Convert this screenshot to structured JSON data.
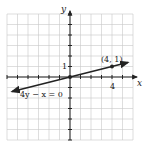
{
  "chart_data": {
    "type": "line",
    "title": "",
    "xlabel": "x",
    "ylabel": "y",
    "xlim": [
      -6,
      6
    ],
    "ylim": [
      -6,
      6
    ],
    "grid": true,
    "x_ticks_labeled": [
      4
    ],
    "y_ticks_labeled": [
      1
    ],
    "series": [
      {
        "name": "4y - x = 0",
        "equation": "y = x/4",
        "x": [
          -5.5,
          5.5
        ],
        "y": [
          -1.375,
          1.375
        ],
        "arrows": "both"
      }
    ],
    "points": [
      {
        "x": 0,
        "y": 0,
        "label": ""
      },
      {
        "x": 4,
        "y": 1,
        "label": "(4, 1)"
      }
    ],
    "annotations": [
      {
        "text": "4y − x = 0",
        "x": -2.8,
        "y": -1.6
      },
      {
        "text": "(4, 1)",
        "x": 4.2,
        "y": 1.7
      }
    ]
  },
  "labels": {
    "x_axis": "x",
    "y_axis": "y",
    "x_tick_4": "4",
    "y_tick_1": "1",
    "equation": "4y − x = 0",
    "point": "(4, 1)"
  }
}
